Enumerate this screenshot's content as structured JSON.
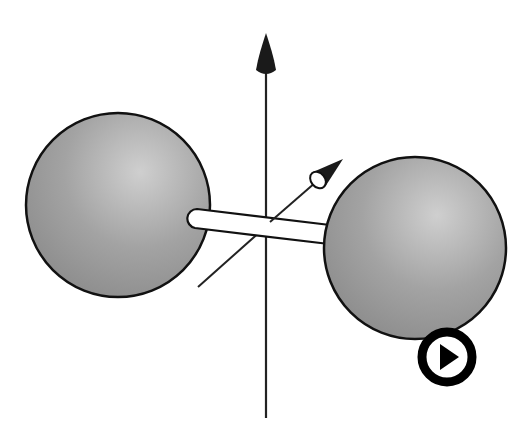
{
  "diagram": {
    "colors": {
      "background": "#ffffff",
      "sphere_fill_light": "#c8c8c8",
      "sphere_fill_dark": "#8a8a8a",
      "outline": "#111111",
      "bond_fill": "#ffffff",
      "axis": "#222222"
    },
    "atoms": [
      {
        "name": "left-atom",
        "cx": 118,
        "cy": 205,
        "r": 92
      },
      {
        "name": "right-atom",
        "cx": 415,
        "cy": 248,
        "r": 91
      }
    ],
    "axes": [
      {
        "name": "vertical-axis",
        "direction": "up"
      },
      {
        "name": "diagonal-axis",
        "direction": "up-right"
      }
    ]
  },
  "controls": {
    "play_button": {
      "icon": "play-icon",
      "label": "Play"
    }
  }
}
